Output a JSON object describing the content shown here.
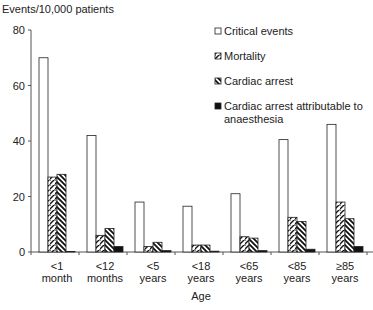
{
  "chart_data": {
    "type": "bar",
    "title": "",
    "ylabel": "Events/10,000 patients",
    "xlabel": "Age",
    "ylim": [
      0,
      80
    ],
    "yticks": [
      0,
      20,
      40,
      60,
      80
    ],
    "grid": false,
    "legend_position": "top-right",
    "categories": [
      [
        "<1",
        "month"
      ],
      [
        "<12",
        "months"
      ],
      [
        "<5",
        "years"
      ],
      [
        "<18",
        "years"
      ],
      [
        "<65",
        "years"
      ],
      [
        "<85",
        "years"
      ],
      [
        "≥85",
        "years"
      ]
    ],
    "series": [
      {
        "name": "Critical events",
        "pattern": "white",
        "values": [
          70,
          42,
          18,
          16.5,
          21,
          40.5,
          46
        ]
      },
      {
        "name": "Mortality",
        "pattern": "hatch-right",
        "values": [
          27,
          6,
          2,
          2.5,
          5.5,
          12.5,
          18
        ]
      },
      {
        "name": "Cardiac arrest",
        "pattern": "hatch-left",
        "values": [
          28,
          8.5,
          3.5,
          2.5,
          5,
          11,
          12
        ]
      },
      {
        "name": "Cardiac arrest attributable to anaesthesia",
        "legend_lines": [
          "Cardiac arrest attributable to",
          "anaesthesia"
        ],
        "pattern": "black",
        "values": [
          0,
          2,
          0.5,
          0.3,
          0.5,
          1,
          2
        ]
      }
    ]
  }
}
